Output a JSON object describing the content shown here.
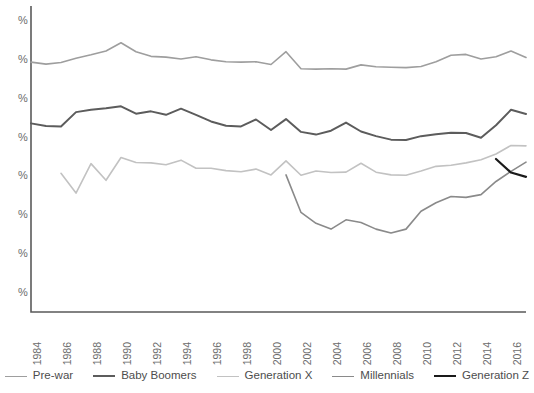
{
  "chart_data": {
    "type": "line",
    "title": "",
    "subtitle": "",
    "xlabel": "",
    "ylabel": "",
    "grid": false,
    "legend_position": "bottom",
    "x": [
      1984,
      1985,
      1986,
      1987,
      1988,
      1989,
      1990,
      1991,
      1992,
      1993,
      1994,
      1995,
      1996,
      1997,
      1998,
      1999,
      2000,
      2001,
      2002,
      2003,
      2004,
      2005,
      2006,
      2007,
      2008,
      2009,
      2010,
      2011,
      2012,
      2013,
      2014,
      2015,
      2016,
      2017
    ],
    "x_tick_labels": [
      "1984",
      "1986",
      "1988",
      "1990",
      "1992",
      "1994",
      "1996",
      "1998",
      "2000",
      "2002",
      "2004",
      "2006",
      "2008",
      "2010",
      "2012",
      "2014",
      "2016"
    ],
    "x_tick_values": [
      1984,
      1986,
      1988,
      1990,
      1992,
      1994,
      1996,
      1998,
      2000,
      2002,
      2004,
      2006,
      2008,
      2010,
      2012,
      2014,
      2016
    ],
    "xlim": [
      1984,
      2017
    ],
    "y_tick_labels": [
      "%",
      "%",
      "%",
      "%",
      "%",
      "%",
      "%",
      "%"
    ],
    "y_tick_note": "y-axis tick labels are clipped by the left edge of the screenshot; only the percent sign is visible",
    "y_tick_values": [
      80,
      70,
      60,
      50,
      40,
      30,
      20,
      10
    ],
    "ylim": [
      5,
      84
    ],
    "series": [
      {
        "name": "Pre-war",
        "color": "#9e9e9e",
        "width": 1.6,
        "values": [
          69.5,
          69.0,
          69.4,
          70.5,
          71.4,
          72.4,
          74.5,
          72.2,
          71.0,
          70.8,
          70.3,
          70.9,
          70.1,
          69.6,
          69.5,
          69.6,
          68.9,
          72.2,
          67.8,
          67.7,
          67.8,
          67.7,
          68.8,
          68.3,
          68.2,
          68.1,
          68.4,
          69.6,
          71.3,
          71.5,
          70.3,
          70.9,
          72.4,
          70.7
        ]
      },
      {
        "name": "Baby Boomers",
        "color": "#5c5c5c",
        "width": 2.0,
        "values": [
          53.7,
          53.0,
          52.9,
          56.6,
          57.2,
          57.6,
          58.1,
          56.2,
          56.8,
          55.9,
          57.5,
          55.9,
          54.2,
          53.1,
          52.9,
          54.7,
          52.0,
          54.8,
          51.5,
          50.8,
          51.8,
          53.9,
          51.6,
          50.4,
          49.5,
          49.4,
          50.4,
          50.9,
          51.3,
          51.2,
          50.0,
          53.2,
          57.2,
          56.1
        ]
      },
      {
        "name": "Generation X",
        "color": "#c2c2c2",
        "width": 1.6,
        "values": [
          null,
          null,
          40.8,
          35.7,
          43.3,
          39.0,
          44.9,
          43.6,
          43.5,
          43.0,
          44.2,
          42.1,
          42.1,
          41.5,
          41.2,
          41.9,
          40.4,
          44.0,
          40.3,
          41.4,
          41.0,
          41.1,
          43.4,
          41.1,
          40.4,
          40.3,
          41.4,
          42.6,
          42.9,
          43.5,
          44.3,
          45.8,
          48.0,
          47.9
        ]
      },
      {
        "name": "Millennials",
        "color": "#8a8a8a",
        "width": 1.6,
        "values": [
          null,
          null,
          null,
          null,
          null,
          null,
          null,
          null,
          null,
          null,
          null,
          null,
          null,
          null,
          null,
          null,
          null,
          40.4,
          30.7,
          27.9,
          26.4,
          28.8,
          28.1,
          26.4,
          25.4,
          26.4,
          31.0,
          33.2,
          34.8,
          34.6,
          35.3,
          38.7,
          41.3,
          43.7
        ]
      },
      {
        "name": "Generation Z",
        "color": "#1a1a1a",
        "width": 2.2,
        "values": [
          null,
          null,
          null,
          null,
          null,
          null,
          null,
          null,
          null,
          null,
          null,
          null,
          null,
          null,
          null,
          null,
          null,
          null,
          null,
          null,
          null,
          null,
          null,
          null,
          null,
          null,
          null,
          null,
          null,
          null,
          null,
          44.5,
          41.0,
          39.9
        ]
      }
    ]
  },
  "legend": {
    "items": [
      {
        "label": "Pre-war",
        "color": "#9e9e9e",
        "width": 1.6
      },
      {
        "label": "Baby Boomers",
        "color": "#5c5c5c",
        "width": 2.4
      },
      {
        "label": "Generation X",
        "color": "#c2c2c2",
        "width": 1.6
      },
      {
        "label": "Millennials",
        "color": "#8a8a8a",
        "width": 1.6
      },
      {
        "label": "Generation Z",
        "color": "#1a1a1a",
        "width": 2.4
      }
    ]
  },
  "axis": {
    "line_color": "#5a5a5a"
  }
}
